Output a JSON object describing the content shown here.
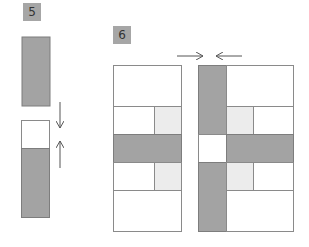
{
  "steps": [
    {
      "label": "5"
    },
    {
      "label": "6"
    }
  ],
  "colors": {
    "dark_fabric": "#a3a3a3",
    "light_fabric": "#ececec",
    "white_fabric": "#ffffff",
    "outline": "#8a8a8a",
    "arrow": "#555555",
    "badge": "#a6a6a6"
  }
}
